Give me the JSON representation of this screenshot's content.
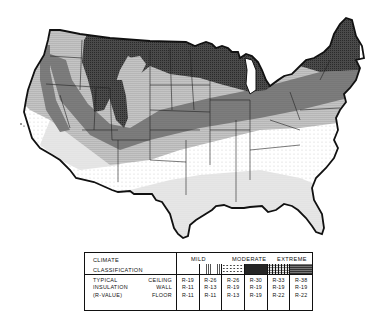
{
  "map": {
    "title": "Climate classification and typical insulation (R-value) map of the contiguous United States",
    "regions_description": [
      {
        "zone": "extreme-dark",
        "areas": "Northern tier: Montana, Dakotas, Minnesota, Wisconsin, Michigan, northern New England, Rockies"
      },
      {
        "zone": "extreme-medium",
        "areas": "Band across Great Lakes states, Ohio Valley, Mid-Atlantic interior"
      },
      {
        "zone": "moderate-dense-dots",
        "areas": "Central band: Nebraska, Kansas, Missouri, Kentucky, Virginia, Idaho, Nevada, Utah"
      },
      {
        "zone": "moderate-light-dots",
        "areas": "Southern plains and southeast interior"
      },
      {
        "zone": "mild",
        "areas": "Gulf coast, Florida, southern Texas, southern California and Arizona"
      }
    ]
  },
  "legend": {
    "left": {
      "climate": "CLIMATE",
      "classification": "CLASSIFICATION",
      "typical": "TYPICAL",
      "insulation": "INSULATION",
      "rvalue": "(R-VALUE)",
      "ceiling": "CEILING",
      "wall": "WALL",
      "floor": "FLOOR"
    },
    "headers": {
      "mild": "MILD",
      "moderate": "MODERATE",
      "extreme": "EXTREME"
    },
    "columns": [
      {
        "pattern": "blank",
        "ceiling": "R-19",
        "wall": "R-11",
        "floor": "R-11"
      },
      {
        "pattern": "grid-light",
        "ceiling": "R-26",
        "wall": "R-13",
        "floor": "R-11"
      },
      {
        "pattern": "sparse-dots",
        "ceiling": "R-26",
        "wall": "R-19",
        "floor": "R-13"
      },
      {
        "pattern": "dense-dots",
        "ceiling": "R-30",
        "wall": "R-19",
        "floor": "R-19"
      },
      {
        "pattern": "coarse-dots",
        "ceiling": "R-33",
        "wall": "R-19",
        "floor": "R-22"
      },
      {
        "pattern": "dark-grid",
        "ceiling": "R-38",
        "wall": "R-19",
        "floor": "R-22"
      }
    ]
  }
}
